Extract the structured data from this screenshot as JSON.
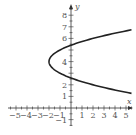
{
  "chart_data": {
    "type": "line",
    "title": "",
    "xlabel": "x",
    "ylabel": "y",
    "xlim": [
      -5.5,
      5.8
    ],
    "ylim": [
      -1.5,
      8.5
    ],
    "x_ticks": [
      -5,
      -4,
      -3,
      -2,
      -1,
      1,
      2,
      3,
      4,
      5
    ],
    "y_ticks": [
      -1,
      1,
      2,
      4,
      6,
      7,
      8
    ],
    "grid": false,
    "series": [
      {
        "name": "parabola x = (y-4)^2 - 2",
        "description": "Horizontal parabola opening right, vertex (-2, 4), y-intercepts at about 2.6 and 5.4",
        "vertex": [
          -2,
          4
        ],
        "points": [
          [
            5.5,
            1.26
          ],
          [
            2,
            2
          ],
          [
            0,
            2.59
          ],
          [
            -1,
            3
          ],
          [
            -2,
            4
          ],
          [
            -1,
            5
          ],
          [
            0,
            5.41
          ],
          [
            2,
            6
          ],
          [
            5.5,
            6.74
          ]
        ]
      }
    ]
  },
  "labels": {
    "x_axis": "x",
    "y_axis": "y",
    "x_ticks": [
      "−5",
      "−4",
      "−3",
      "−2",
      "−1",
      "1",
      "2",
      "3",
      "4",
      "5"
    ],
    "y_ticks": [
      "−1",
      "1",
      "2",
      "4",
      "6",
      "7",
      "8"
    ]
  }
}
